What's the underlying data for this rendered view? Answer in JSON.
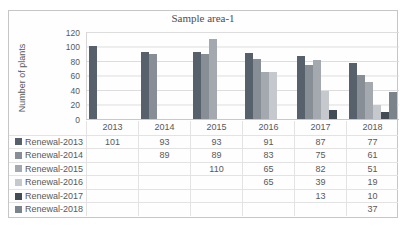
{
  "figure": {
    "title": "Sample area-1",
    "y_axis_label": "Number of plants"
  },
  "colors": {
    "series": [
      "#57616b",
      "#878e95",
      "#a3a9af",
      "#c5c9cd",
      "#434c55",
      "#7b838b"
    ],
    "text": "#595959",
    "gridline": "#dcdcdc",
    "frame_border": "#c6c6c6"
  },
  "chart_data": {
    "type": "bar",
    "title": "Sample area-1",
    "xlabel": "",
    "ylabel": "Number of plants",
    "ylim": [
      0,
      120
    ],
    "yticks": [
      120,
      100,
      80,
      60,
      40,
      20,
      0
    ],
    "grid": true,
    "legend_position": "data-table-left",
    "categories": [
      "2013",
      "2014",
      "2015",
      "2016",
      "2017",
      "2018"
    ],
    "series": [
      {
        "name": "Renewal-2013",
        "color": "#57616b",
        "values": [
          101,
          93,
          93,
          91,
          87,
          77
        ]
      },
      {
        "name": "Renewal-2014",
        "color": "#878e95",
        "values": [
          null,
          89,
          89,
          83,
          75,
          61
        ]
      },
      {
        "name": "Renewal-2015",
        "color": "#a3a9af",
        "values": [
          null,
          null,
          110,
          65,
          82,
          51
        ]
      },
      {
        "name": "Renewal-2016",
        "color": "#c5c9cd",
        "values": [
          null,
          null,
          null,
          65,
          39,
          19
        ]
      },
      {
        "name": "Renewal-2017",
        "color": "#434c55",
        "values": [
          null,
          null,
          null,
          null,
          13,
          10
        ]
      },
      {
        "name": "Renewal-2018",
        "color": "#7b838b",
        "values": [
          null,
          null,
          null,
          null,
          null,
          37
        ]
      }
    ]
  }
}
